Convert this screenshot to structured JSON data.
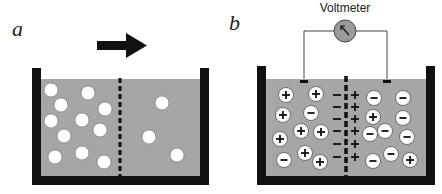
{
  "panel_a": {
    "label": "a",
    "arrow_direction": "right",
    "particles": [
      [
        51,
        90
      ],
      [
        88,
        93
      ],
      [
        61,
        105
      ],
      [
        105,
        109
      ],
      [
        51,
        121
      ],
      [
        82,
        120
      ],
      [
        100,
        130
      ],
      [
        64,
        136
      ],
      [
        55,
        157
      ],
      [
        82,
        153
      ],
      [
        104,
        162
      ],
      [
        162,
        103
      ],
      [
        149,
        137
      ],
      [
        177,
        155
      ]
    ]
  },
  "panel_b": {
    "label": "b",
    "voltmeter_label": "Voltmeter",
    "ions": [
      {
        "x": 286,
        "y": 95,
        "s": "+"
      },
      {
        "x": 316,
        "y": 94,
        "s": "+"
      },
      {
        "x": 283,
        "y": 115,
        "s": "+"
      },
      {
        "x": 311,
        "y": 113,
        "s": "-"
      },
      {
        "x": 301,
        "y": 131,
        "s": "+"
      },
      {
        "x": 321,
        "y": 132,
        "s": "+"
      },
      {
        "x": 280,
        "y": 139,
        "s": "+"
      },
      {
        "x": 284,
        "y": 160,
        "s": "-"
      },
      {
        "x": 305,
        "y": 153,
        "s": "+"
      },
      {
        "x": 320,
        "y": 162,
        "s": "+"
      },
      {
        "x": 374,
        "y": 98,
        "s": "-"
      },
      {
        "x": 403,
        "y": 98,
        "s": "-"
      },
      {
        "x": 373,
        "y": 117,
        "s": "+"
      },
      {
        "x": 403,
        "y": 118,
        "s": "-"
      },
      {
        "x": 370,
        "y": 134,
        "s": "-"
      },
      {
        "x": 385,
        "y": 131,
        "s": "-"
      },
      {
        "x": 407,
        "y": 137,
        "s": "-"
      },
      {
        "x": 373,
        "y": 161,
        "s": "-"
      },
      {
        "x": 391,
        "y": 154,
        "s": "-"
      },
      {
        "x": 410,
        "y": 160,
        "s": "+"
      }
    ],
    "membrane_left_charges": [
      "−",
      "−",
      "−",
      "−",
      "−",
      "−"
    ],
    "membrane_right_charges": [
      "+",
      "+",
      "+",
      "+",
      "+",
      "+"
    ]
  },
  "colors": {
    "wall": "#111111",
    "liquid": "#a6a6a6",
    "particle": "#ffffff",
    "voltmeter_fill": "#9a9a9a"
  }
}
